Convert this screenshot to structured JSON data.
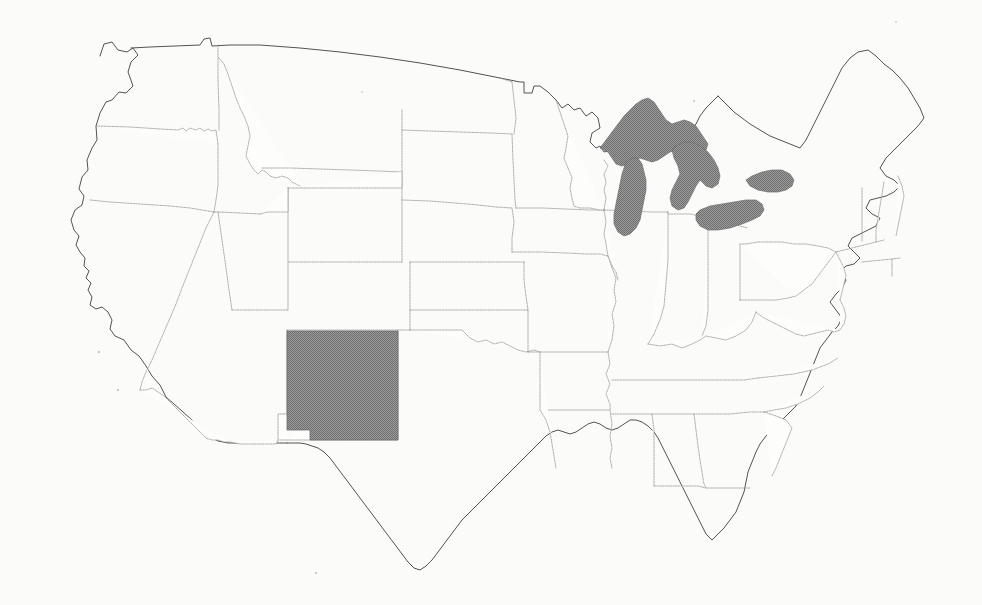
{
  "map": {
    "title": "United States Outline Map",
    "projection": "albers-usa",
    "background_color": "#fbfbfa",
    "border_color": "#8f8f8f",
    "coastline_color": "#4a4a4a",
    "highlight_color": "#808080",
    "lake_color": "#8a8a8a",
    "highlighted_states": [
      "New Mexico"
    ],
    "shaded_water_bodies": [
      "Lake Superior",
      "Lake Michigan",
      "Lake Huron",
      "Lake Erie",
      "Lake Ontario"
    ],
    "legend": [],
    "labels": [],
    "states": [
      "Washington",
      "Oregon",
      "California",
      "Idaho",
      "Nevada",
      "Utah",
      "Arizona",
      "Montana",
      "Wyoming",
      "Colorado",
      "New Mexico",
      "North Dakota",
      "South Dakota",
      "Nebraska",
      "Kansas",
      "Oklahoma",
      "Texas",
      "Minnesota",
      "Iowa",
      "Missouri",
      "Arkansas",
      "Louisiana",
      "Wisconsin",
      "Illinois",
      "Michigan",
      "Indiana",
      "Ohio",
      "Kentucky",
      "Tennessee",
      "Mississippi",
      "Alabama",
      "Georgia",
      "Florida",
      "South Carolina",
      "North Carolina",
      "Virginia",
      "West Virginia",
      "Maryland",
      "Delaware",
      "Pennsylvania",
      "New Jersey",
      "New York",
      "Connecticut",
      "Rhode Island",
      "Massachusetts",
      "Vermont",
      "New Hampshire",
      "Maine"
    ]
  }
}
